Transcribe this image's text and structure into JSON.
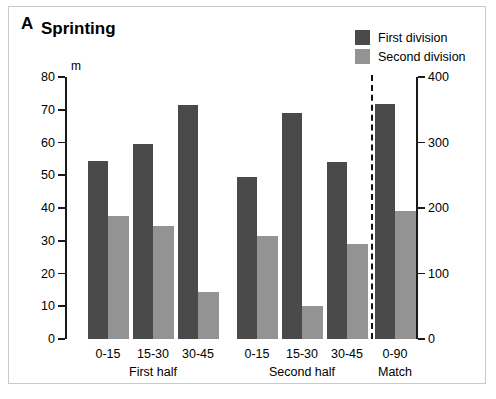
{
  "panel": {
    "letter": "A",
    "title": "Sprinting"
  },
  "legend": {
    "items": [
      {
        "label": "First division",
        "color": "#4a4a4a",
        "name": "legend-first-division"
      },
      {
        "label": "Second division",
        "color": "#939393",
        "name": "legend-second-division"
      }
    ]
  },
  "chart_data": {
    "type": "bar",
    "title": "Sprinting",
    "xlabel": "",
    "ylabel": "m",
    "unit_label": "m",
    "grid": false,
    "legend_position": "top-right",
    "categories": [
      "0-15",
      "15-30",
      "30-45",
      "0-15",
      "15-30",
      "30-45",
      "0-90"
    ],
    "groups": [
      {
        "label": "First half",
        "categories": [
          "0-15",
          "15-30",
          "30-45"
        ]
      },
      {
        "label": "Second half",
        "categories": [
          "0-15",
          "15-30",
          "30-45"
        ]
      },
      {
        "label": "Match",
        "categories": [
          "0-90"
        ]
      }
    ],
    "series": [
      {
        "name": "First division",
        "color": "#4a4a4a",
        "axis": "left",
        "values": [
          54.5,
          59.5,
          71.5,
          49.5,
          69.0,
          54.0,
          71.8
        ]
      },
      {
        "name": "Second division",
        "color": "#939393",
        "axis": "left",
        "values": [
          37.5,
          34.5,
          14.5,
          31.5,
          10.0,
          29.0,
          39.0
        ]
      }
    ],
    "yaxis_left": {
      "label": "m",
      "ticks": [
        0,
        10,
        20,
        30,
        40,
        50,
        60,
        70,
        80
      ],
      "ylim": [
        0,
        80
      ]
    },
    "yaxis_right": {
      "label": "",
      "ticks": [
        0,
        100,
        200,
        300,
        400
      ],
      "ylim": [
        0,
        400
      ]
    },
    "annotations": [
      {
        "type": "vertical-dashed-divider",
        "after_category_index": 5
      }
    ]
  }
}
